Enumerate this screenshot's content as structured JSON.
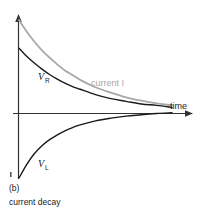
{
  "figure": {
    "panel_label": "(b)",
    "caption": "current decay",
    "axes": {
      "x_axis_label": "time",
      "y_axis_label": ""
    },
    "annotations": [
      {
        "name": "vr-label",
        "text": "V",
        "subscript": "R",
        "color": "#1a1a1a"
      },
      {
        "name": "vl-label",
        "text": "V",
        "subscript": "L",
        "color": "#1a1a1a"
      },
      {
        "name": "current-label",
        "text": "current I",
        "color": "#a8a8a8"
      }
    ]
  },
  "chart_data": {
    "type": "line",
    "title": "current decay",
    "subtitle": "(b)",
    "xlabel": "time",
    "ylabel": "",
    "grid": false,
    "legend": "inline-annotations",
    "xlim": [
      0,
      1
    ],
    "ylim": [
      -1,
      1.35
    ],
    "x": [
      0,
      0.05,
      0.1,
      0.15,
      0.2,
      0.25,
      0.3,
      0.35,
      0.4,
      0.5,
      0.6,
      0.7,
      0.8,
      0.9,
      1.0
    ],
    "series": [
      {
        "name": "current I",
        "color": "#a8a8a8",
        "start_value": 1.35,
        "values": [
          1.35,
          1.18,
          1.03,
          0.9,
          0.79,
          0.69,
          0.6,
          0.53,
          0.46,
          0.35,
          0.27,
          0.2,
          0.15,
          0.11,
          0.08
        ]
      },
      {
        "name": "V_R",
        "color": "#1a1a1a",
        "start_value": 0.93,
        "values": [
          0.93,
          0.81,
          0.71,
          0.62,
          0.54,
          0.47,
          0.41,
          0.36,
          0.32,
          0.24,
          0.18,
          0.14,
          0.1,
          0.08,
          0.05
        ]
      },
      {
        "name": "V_L",
        "color": "#1a1a1a",
        "start_value": -1.0,
        "values": [
          -1.0,
          -0.8,
          -0.64,
          -0.52,
          -0.43,
          -0.36,
          -0.3,
          -0.25,
          -0.21,
          -0.15,
          -0.11,
          -0.08,
          -0.06,
          -0.04,
          -0.03
        ]
      }
    ]
  }
}
